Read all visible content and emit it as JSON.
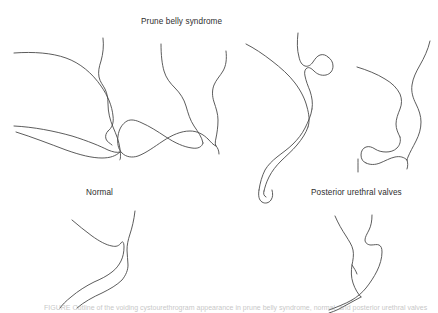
{
  "figure": {
    "background_color": "#ffffff",
    "line_color": "#4a4a4a",
    "text_color": "#2e2e2e",
    "title": "Prune belly syndrome",
    "labels": {
      "normal": "Normal",
      "posterior_urethral_valves": "Posterior urethral valves"
    },
    "caption_partial": "FIGURE  Outline of the voiding cystourethrogram appearance in prune belly syndrome, normal, and posterior urethral valves"
  },
  "panels": [
    {
      "id": "pbs-1",
      "group": "Prune belly syndrome",
      "position": "top-row-1",
      "description": "Large dilated bladder outline with wide bladder neck tapering to urethra"
    },
    {
      "id": "pbs-2",
      "group": "Prune belly syndrome",
      "position": "top-row-2",
      "description": "Funnelled bladder neck with markedly dilated tortuous anterior urethra"
    },
    {
      "id": "pbs-3",
      "group": "Prune belly syndrome",
      "position": "top-row-3",
      "description": "Bladder with urachal diverticulum and wide megalourethra"
    },
    {
      "id": "pbs-4",
      "group": "Prune belly syndrome",
      "position": "top-row-4",
      "description": "Irregular bladder base with dilated posterior urethra"
    },
    {
      "id": "normal",
      "group": "Normal",
      "position": "bottom-left",
      "description": "Normal bladder base with smooth narrow urethra"
    },
    {
      "id": "puv",
      "group": "Posterior urethral valves",
      "position": "bottom-right",
      "description": "Dilated posterior urethra with abrupt caliber change at valve, narrow distal urethra"
    }
  ]
}
